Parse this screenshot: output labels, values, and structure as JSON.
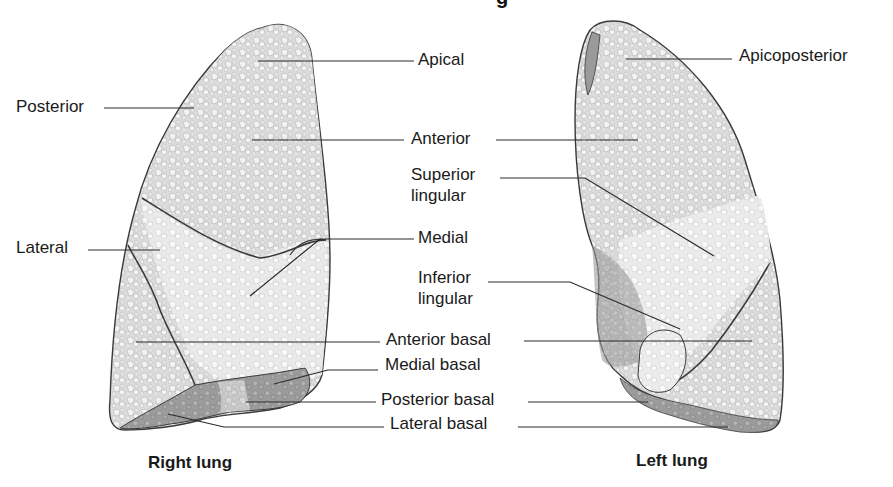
{
  "title": {
    "visible_fragment": "g"
  },
  "right_lung": {
    "caption": "Right lung",
    "labels": {
      "apical": "Apical",
      "posterior": "Posterior",
      "anterior": "Anterior",
      "lateral": "Lateral",
      "medial": "Medial",
      "anterior_basal": "Anterior basal",
      "medial_basal": "Medial basal",
      "posterior_basal": "Posterior basal",
      "lateral_basal": "Lateral basal"
    }
  },
  "left_lung": {
    "caption": "Left lung",
    "labels": {
      "apicoposterior": "Apicoposterior",
      "anterior": "Anterior",
      "superior_lingular_1": "Superior",
      "superior_lingular_2": "lingular",
      "inferior_lingular_1": "Inferior",
      "inferior_lingular_2": "lingular",
      "anterior_basal": "Anterior basal",
      "posterior_basal": "Posterior basal",
      "lateral_basal": "Lateral basal"
    }
  },
  "colors": {
    "background": "#ffffff",
    "lung_fill_light": "#e4e4e4",
    "lung_fill_mid": "#cfcfcf",
    "lung_fill_dark": "#9a9a9a",
    "outline": "#3a3a3a",
    "leader_line": "#2a2a2a",
    "text": "#1a1a1a"
  }
}
